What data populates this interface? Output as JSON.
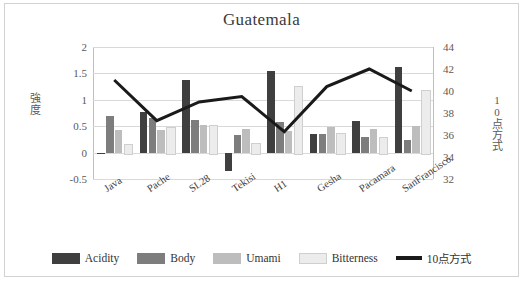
{
  "chart_data": {
    "type": "bar",
    "title": "Guatemala",
    "xlabel": "",
    "ylabel": "強度",
    "y2label": "10点方式",
    "categories": [
      "Java",
      "Pache",
      "SL28",
      "Tekisi",
      "H1",
      "Gesha",
      "Pacamara",
      "SanFrancisco"
    ],
    "ylim": [
      -0.5,
      2
    ],
    "yticks": [
      2,
      1.5,
      1,
      0.5,
      0,
      -0.5
    ],
    "y2lim": [
      32,
      44
    ],
    "y2ticks": [
      44,
      42,
      40,
      38,
      36,
      34,
      32
    ],
    "grid": true,
    "legend_position": "bottom",
    "series": [
      {
        "name": "Acidity",
        "type": "bar",
        "color": "#3f3f3f",
        "axis": "left",
        "values": [
          -0.02,
          0.76,
          1.37,
          -0.35,
          1.54,
          0.36,
          0.6,
          1.62
        ]
      },
      {
        "name": "Body",
        "type": "bar",
        "color": "#7d7d7d",
        "axis": "left",
        "values": [
          0.69,
          0.66,
          0.61,
          0.33,
          0.58,
          0.36,
          0.29,
          0.24
        ]
      },
      {
        "name": "Umami",
        "type": "bar",
        "color": "#bdbdbd",
        "axis": "left",
        "values": [
          0.42,
          0.43,
          0.53,
          0.44,
          0.41,
          0.48,
          0.45,
          0.5
        ]
      },
      {
        "name": "Bitterness",
        "type": "bar",
        "color": "#ececec",
        "axis": "left",
        "values": [
          0.17,
          0.49,
          0.53,
          0.18,
          1.27,
          0.37,
          0.3,
          1.18
        ]
      },
      {
        "name": "10点方式",
        "type": "line",
        "color": "#1a1a1a",
        "axis": "right",
        "values": [
          41.0,
          37.3,
          39.0,
          39.5,
          36.3,
          40.4,
          42.0,
          40.0
        ]
      }
    ]
  }
}
